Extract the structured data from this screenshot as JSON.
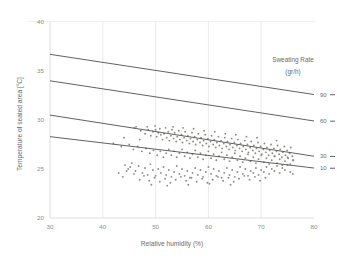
{
  "chart_data": {
    "type": "scatter",
    "title": "",
    "xlabel": "Relative humidity (%)",
    "ylabel": "Temperature of seated area [°C]",
    "xlim": [
      30,
      80
    ],
    "ylim": [
      20,
      40
    ],
    "xticks": [
      30,
      40,
      50,
      60,
      70,
      80
    ],
    "yticks": [
      20,
      25,
      30,
      35,
      40
    ],
    "grid": "vertical",
    "legend_position": "right",
    "legend_title": "Sweating Rate",
    "legend_units": "(gr/h)",
    "series": [
      {
        "name": "measurements",
        "marker": "dot",
        "color": "#8d8d86",
        "points": [
          [
            46.3,
            29.3
          ],
          [
            47.2,
            28.9
          ],
          [
            48.0,
            28.6
          ],
          [
            48.6,
            29.0
          ],
          [
            49.1,
            28.4
          ],
          [
            49.5,
            28.8
          ],
          [
            50.0,
            29.0
          ],
          [
            50.2,
            28.3
          ],
          [
            50.5,
            28.7
          ],
          [
            50.8,
            29.1
          ],
          [
            51.0,
            28.5
          ],
          [
            51.3,
            28.0
          ],
          [
            51.6,
            28.6
          ],
          [
            51.9,
            29.2
          ],
          [
            52.1,
            28.2
          ],
          [
            52.4,
            28.8
          ],
          [
            52.6,
            27.9
          ],
          [
            52.9,
            28.4
          ],
          [
            53.1,
            29.0
          ],
          [
            53.4,
            28.1
          ],
          [
            53.6,
            28.7
          ],
          [
            53.9,
            27.8
          ],
          [
            54.1,
            28.3
          ],
          [
            54.4,
            28.9
          ],
          [
            54.6,
            28.0
          ],
          [
            54.9,
            28.5
          ],
          [
            55.1,
            27.7
          ],
          [
            55.4,
            28.2
          ],
          [
            55.6,
            28.8
          ],
          [
            55.9,
            27.9
          ],
          [
            56.1,
            28.4
          ],
          [
            56.4,
            27.6
          ],
          [
            56.6,
            28.1
          ],
          [
            56.9,
            28.7
          ],
          [
            57.1,
            27.8
          ],
          [
            57.4,
            28.3
          ],
          [
            57.6,
            27.5
          ],
          [
            57.9,
            28.0
          ],
          [
            58.1,
            28.6
          ],
          [
            58.4,
            27.7
          ],
          [
            58.6,
            28.2
          ],
          [
            58.9,
            27.4
          ],
          [
            59.1,
            27.9
          ],
          [
            59.4,
            28.5
          ],
          [
            59.6,
            27.6
          ],
          [
            59.9,
            28.1
          ],
          [
            60.1,
            27.3
          ],
          [
            60.4,
            27.8
          ],
          [
            60.6,
            28.4
          ],
          [
            60.9,
            27.5
          ],
          [
            61.1,
            28.0
          ],
          [
            61.4,
            27.2
          ],
          [
            61.6,
            27.7
          ],
          [
            61.9,
            28.3
          ],
          [
            62.1,
            27.4
          ],
          [
            62.4,
            27.9
          ],
          [
            62.6,
            27.1
          ],
          [
            62.9,
            27.6
          ],
          [
            63.1,
            28.2
          ],
          [
            63.4,
            27.3
          ],
          [
            63.6,
            27.8
          ],
          [
            63.9,
            27.0
          ],
          [
            64.1,
            27.5
          ],
          [
            64.4,
            28.1
          ],
          [
            64.6,
            27.2
          ],
          [
            64.9,
            27.7
          ],
          [
            65.1,
            26.9
          ],
          [
            65.4,
            27.4
          ],
          [
            65.6,
            28.0
          ],
          [
            65.9,
            27.1
          ],
          [
            66.1,
            27.6
          ],
          [
            66.4,
            26.8
          ],
          [
            66.6,
            27.3
          ],
          [
            66.9,
            27.9
          ],
          [
            67.1,
            27.0
          ],
          [
            67.4,
            27.5
          ],
          [
            67.6,
            26.7
          ],
          [
            67.9,
            27.2
          ],
          [
            68.1,
            27.8
          ],
          [
            68.4,
            26.9
          ],
          [
            68.6,
            27.4
          ],
          [
            68.9,
            26.6
          ],
          [
            69.1,
            27.1
          ],
          [
            69.4,
            27.7
          ],
          [
            69.6,
            26.8
          ],
          [
            69.9,
            27.3
          ],
          [
            70.1,
            26.5
          ],
          [
            70.4,
            27.0
          ],
          [
            70.6,
            27.6
          ],
          [
            70.9,
            26.7
          ],
          [
            71.1,
            27.2
          ],
          [
            71.4,
            26.4
          ],
          [
            71.6,
            26.9
          ],
          [
            71.9,
            27.5
          ],
          [
            72.1,
            26.6
          ],
          [
            72.4,
            27.1
          ],
          [
            72.6,
            26.3
          ],
          [
            72.9,
            26.8
          ],
          [
            73.1,
            27.4
          ],
          [
            73.4,
            26.5
          ],
          [
            73.6,
            27.0
          ],
          [
            73.9,
            26.2
          ],
          [
            74.1,
            26.7
          ],
          [
            74.4,
            27.3
          ],
          [
            74.6,
            26.4
          ],
          [
            74.9,
            26.9
          ],
          [
            75.1,
            26.1
          ],
          [
            75.4,
            26.6
          ],
          [
            75.6,
            27.2
          ],
          [
            75.9,
            26.3
          ],
          [
            72.9,
            27.9
          ],
          [
            76.1,
            25.9
          ],
          [
            45.0,
            27.5
          ],
          [
            45.8,
            27.0
          ],
          [
            46.6,
            27.3
          ],
          [
            47.4,
            26.8
          ],
          [
            48.2,
            27.1
          ],
          [
            48.9,
            26.6
          ],
          [
            49.6,
            26.9
          ],
          [
            50.3,
            26.4
          ],
          [
            50.9,
            26.8
          ],
          [
            51.5,
            26.2
          ],
          [
            52.0,
            26.6
          ],
          [
            52.5,
            27.0
          ],
          [
            53.0,
            26.4
          ],
          [
            53.5,
            26.8
          ],
          [
            54.0,
            26.2
          ],
          [
            54.5,
            26.6
          ],
          [
            55.0,
            27.0
          ],
          [
            55.5,
            26.3
          ],
          [
            56.0,
            26.7
          ],
          [
            56.5,
            26.1
          ],
          [
            57.0,
            26.5
          ],
          [
            57.5,
            26.9
          ],
          [
            58.0,
            26.2
          ],
          [
            58.5,
            26.6
          ],
          [
            59.0,
            26.0
          ],
          [
            59.5,
            26.4
          ],
          [
            60.0,
            26.8
          ],
          [
            60.5,
            26.1
          ],
          [
            61.0,
            26.5
          ],
          [
            61.5,
            25.9
          ],
          [
            62.0,
            26.3
          ],
          [
            62.5,
            26.7
          ],
          [
            63.0,
            26.0
          ],
          [
            63.5,
            26.4
          ],
          [
            64.0,
            25.8
          ],
          [
            64.5,
            26.2
          ],
          [
            65.0,
            26.6
          ],
          [
            65.5,
            25.9
          ],
          [
            66.0,
            26.3
          ],
          [
            66.5,
            25.7
          ],
          [
            67.0,
            26.1
          ],
          [
            67.5,
            26.5
          ],
          [
            68.0,
            25.8
          ],
          [
            68.5,
            26.2
          ],
          [
            69.0,
            25.6
          ],
          [
            69.5,
            26.0
          ],
          [
            70.0,
            26.4
          ],
          [
            70.5,
            25.7
          ],
          [
            71.0,
            26.1
          ],
          [
            71.5,
            25.5
          ],
          [
            72.0,
            25.9
          ],
          [
            72.5,
            26.3
          ],
          [
            73.0,
            25.6
          ],
          [
            73.5,
            26.0
          ],
          [
            74.0,
            25.4
          ],
          [
            74.5,
            25.8
          ],
          [
            75.0,
            26.2
          ],
          [
            75.5,
            25.5
          ],
          [
            76.0,
            25.9
          ],
          [
            42.0,
            27.6
          ],
          [
            43.5,
            27.3
          ],
          [
            44.2,
            25.4
          ],
          [
            44.8,
            25.0
          ],
          [
            45.5,
            25.6
          ],
          [
            46.2,
            24.8
          ],
          [
            46.8,
            25.3
          ],
          [
            47.5,
            24.6
          ],
          [
            48.0,
            25.1
          ],
          [
            48.5,
            24.4
          ],
          [
            49.0,
            25.5
          ],
          [
            49.5,
            24.9
          ],
          [
            50.0,
            24.3
          ],
          [
            50.5,
            25.0
          ],
          [
            51.0,
            24.6
          ],
          [
            51.5,
            25.2
          ],
          [
            52.0,
            24.4
          ],
          [
            52.5,
            24.9
          ],
          [
            53.0,
            24.2
          ],
          [
            53.5,
            24.7
          ],
          [
            54.0,
            25.3
          ],
          [
            54.5,
            24.5
          ],
          [
            55.0,
            25.0
          ],
          [
            55.5,
            24.3
          ],
          [
            56.0,
            24.8
          ],
          [
            56.5,
            24.1
          ],
          [
            57.0,
            24.6
          ],
          [
            57.5,
            25.1
          ],
          [
            58.0,
            24.4
          ],
          [
            58.5,
            24.9
          ],
          [
            59.0,
            24.2
          ],
          [
            59.5,
            24.7
          ],
          [
            60.0,
            25.2
          ],
          [
            60.5,
            24.5
          ],
          [
            61.0,
            25.0
          ],
          [
            61.5,
            24.3
          ],
          [
            62.0,
            24.8
          ],
          [
            62.5,
            24.1
          ],
          [
            63.0,
            24.6
          ],
          [
            63.5,
            25.1
          ],
          [
            64.0,
            24.4
          ],
          [
            64.5,
            24.9
          ],
          [
            65.0,
            24.2
          ],
          [
            65.5,
            24.7
          ],
          [
            66.0,
            25.2
          ],
          [
            66.5,
            24.5
          ],
          [
            67.0,
            25.0
          ],
          [
            67.5,
            24.3
          ],
          [
            68.0,
            24.8
          ],
          [
            68.5,
            24.6
          ],
          [
            69.0,
            25.1
          ],
          [
            69.5,
            24.4
          ],
          [
            70.0,
            24.9
          ],
          [
            70.5,
            24.7
          ],
          [
            71.0,
            25.2
          ],
          [
            71.5,
            24.5
          ],
          [
            72.0,
            25.0
          ],
          [
            72.5,
            24.8
          ],
          [
            73.0,
            25.3
          ],
          [
            73.5,
            24.6
          ],
          [
            74.0,
            25.1
          ],
          [
            74.5,
            24.9
          ],
          [
            75.0,
            25.4
          ],
          [
            75.5,
            24.7
          ],
          [
            76.0,
            24.5
          ],
          [
            43.0,
            24.6
          ],
          [
            43.8,
            24.2
          ],
          [
            44.5,
            24.8
          ],
          [
            45.2,
            25.2
          ],
          [
            45.9,
            24.5
          ],
          [
            47.0,
            23.9
          ],
          [
            47.8,
            24.3
          ],
          [
            48.8,
            23.8
          ],
          [
            49.8,
            24.1
          ],
          [
            50.8,
            23.7
          ],
          [
            51.8,
            24.0
          ],
          [
            52.8,
            23.6
          ],
          [
            53.8,
            23.9
          ],
          [
            54.8,
            24.2
          ],
          [
            55.8,
            23.8
          ],
          [
            56.8,
            24.1
          ],
          [
            57.8,
            23.7
          ],
          [
            58.8,
            24.0
          ],
          [
            59.8,
            23.6
          ],
          [
            60.8,
            23.9
          ],
          [
            61.8,
            24.2
          ],
          [
            62.8,
            23.8
          ],
          [
            63.8,
            24.1
          ],
          [
            64.8,
            23.7
          ],
          [
            65.8,
            24.0
          ],
          [
            66.8,
            24.3
          ],
          [
            67.8,
            23.9
          ],
          [
            68.8,
            24.2
          ],
          [
            69.8,
            23.8
          ],
          [
            70.8,
            24.1
          ],
          [
            49.2,
            23.4
          ],
          [
            52.2,
            23.3
          ],
          [
            56.2,
            23.4
          ],
          [
            60.2,
            23.5
          ],
          [
            64.2,
            23.4
          ],
          [
            49.9,
            29.4
          ],
          [
            53.3,
            29.3
          ],
          [
            55.2,
            29.2
          ],
          [
            57.2,
            29.1
          ],
          [
            59.2,
            28.9
          ],
          [
            61.2,
            28.8
          ],
          [
            63.2,
            28.6
          ],
          [
            65.2,
            28.5
          ],
          [
            67.2,
            28.3
          ],
          [
            69.2,
            28.2
          ],
          [
            44.0,
            28.2
          ],
          [
            46.0,
            29.2
          ],
          [
            47.0,
            28.0
          ],
          [
            48.4,
            29.3
          ]
        ]
      }
    ],
    "model_lines": [
      {
        "label": "90",
        "x0": 30,
        "y0": 36.7,
        "x1": 80,
        "y1": 32.6
      },
      {
        "label": "60",
        "x0": 30,
        "y0": 34.0,
        "x1": 80,
        "y1": 29.9
      },
      {
        "label": "30",
        "x0": 30,
        "y0": 30.5,
        "x1": 80,
        "y1": 26.3
      },
      {
        "label": "10",
        "x0": 30,
        "y0": 28.3,
        "x1": 80,
        "y1": 25.1
      }
    ]
  }
}
